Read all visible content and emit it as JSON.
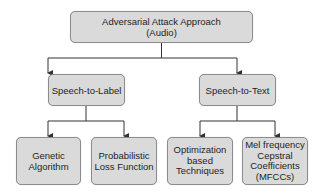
{
  "diagram": {
    "type": "tree",
    "colors": {
      "node_fill": "#dadada",
      "node_border": "#8c8c8c",
      "edge": "#333333",
      "text": "#1e1e1e"
    },
    "root": {
      "id": "root",
      "label": "Adversarial Attack Approach\n(Audio)"
    },
    "level1": [
      {
        "id": "s2l",
        "label": "Speech-to-Label"
      },
      {
        "id": "s2t",
        "label": "Speech-to-Text"
      }
    ],
    "level2": [
      {
        "id": "ga",
        "parent": "s2l",
        "label": "Genetic\nAlgorithm"
      },
      {
        "id": "plf",
        "parent": "s2l",
        "label": "Probabilistic\nLoss Function"
      },
      {
        "id": "obt",
        "parent": "s2t",
        "label": "Optimization\nbased\nTechniques"
      },
      {
        "id": "mfcc",
        "parent": "s2t",
        "label": "Mel frequency\nCepstral\nCoefficients\n(MFCCs)"
      }
    ],
    "edges": [
      {
        "from": "root",
        "to": "s2l"
      },
      {
        "from": "root",
        "to": "s2t"
      },
      {
        "from": "s2l",
        "to": "ga"
      },
      {
        "from": "s2l",
        "to": "plf"
      },
      {
        "from": "s2t",
        "to": "obt"
      },
      {
        "from": "s2t",
        "to": "mfcc"
      }
    ]
  }
}
